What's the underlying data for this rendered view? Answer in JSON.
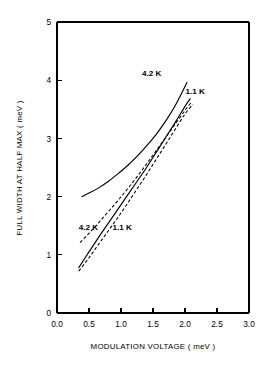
{
  "chart_data": {
    "type": "line",
    "title": "",
    "xlabel": "MODULATION VOLTAGE ( meV )",
    "ylabel": "FULL WIDTH AT HALF MAX ( meV )",
    "xlim": [
      0.0,
      3.0
    ],
    "ylim": [
      0,
      5
    ],
    "xticks": [
      "0.0",
      "0.5",
      "1.0",
      "1.5",
      "2.0",
      "2.5",
      "3.0"
    ],
    "xtick_values": [
      0.0,
      0.5,
      1.0,
      1.5,
      2.0,
      2.5,
      3.0
    ],
    "yticks": [
      "0",
      "1",
      "2",
      "3",
      "4",
      "5"
    ],
    "ytick_values": [
      0,
      1,
      2,
      3,
      4,
      5
    ],
    "grid": false,
    "legend_position": "inline-annotations",
    "series": [
      {
        "name": "4.2 K (measured)",
        "label": "4.2 K",
        "style": "solid",
        "color": "#000000",
        "annotation": {
          "text": "4.2 K",
          "x": 1.48,
          "y": 4.08
        },
        "x": [
          0.39,
          0.5,
          0.65,
          0.8,
          0.95,
          1.1,
          1.25,
          1.4,
          1.55,
          1.7,
          1.85,
          2.03
        ],
        "y": [
          2.0,
          2.06,
          2.15,
          2.26,
          2.39,
          2.53,
          2.69,
          2.87,
          3.07,
          3.3,
          3.57,
          3.96
        ]
      },
      {
        "name": "1.1 K (measured)",
        "label": "1.1 K",
        "style": "solid",
        "color": "#000000",
        "annotation": {
          "text": "1.1 K",
          "x": 2.16,
          "y": 3.76
        },
        "x": [
          0.34,
          0.5,
          0.65,
          0.8,
          0.95,
          1.1,
          1.25,
          1.4,
          1.55,
          1.7,
          1.85,
          2.0,
          2.08
        ],
        "y": [
          0.78,
          1.05,
          1.3,
          1.54,
          1.78,
          2.02,
          2.26,
          2.5,
          2.76,
          3.02,
          3.28,
          3.55,
          3.68
        ]
      },
      {
        "name": "4.2 K (calculated)",
        "label": "4.2 K",
        "style": "dashed",
        "color": "#000000",
        "annotation": {
          "text": "4.2 K",
          "x": 0.49,
          "y": 1.42
        },
        "x": [
          0.36,
          0.5,
          0.65,
          0.8,
          0.95,
          1.1,
          1.25,
          1.4,
          1.55,
          1.7,
          1.85,
          2.0,
          2.1
        ],
        "y": [
          1.21,
          1.37,
          1.55,
          1.74,
          1.93,
          2.13,
          2.34,
          2.56,
          2.79,
          3.02,
          3.25,
          3.48,
          3.62
        ]
      },
      {
        "name": "1.1 K (calculated)",
        "label": "1.1 K",
        "style": "dashed",
        "color": "#000000",
        "annotation": {
          "text": "1.1 K",
          "x": 1.02,
          "y": 1.42
        },
        "x": [
          0.34,
          0.5,
          0.65,
          0.8,
          0.95,
          1.1,
          1.25,
          1.4,
          1.55,
          1.7,
          1.85,
          2.0,
          2.12
        ],
        "y": [
          0.72,
          0.95,
          1.18,
          1.41,
          1.64,
          1.88,
          2.13,
          2.38,
          2.64,
          2.9,
          3.16,
          3.42,
          3.58
        ]
      }
    ]
  }
}
